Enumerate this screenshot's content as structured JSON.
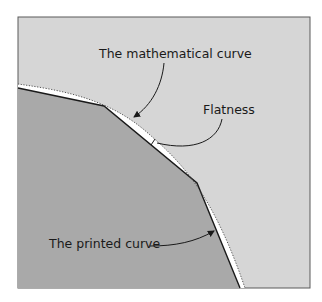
{
  "diagram": {
    "labels": {
      "mathematical_curve": "The mathematical curve",
      "flatness": "Flatness",
      "printed_curve": "The printed curve"
    },
    "colors": {
      "background": "#d6d6d6",
      "printed_region": "#a9a9a9",
      "gap": "#ffffff",
      "stroke": "#1a1a1a",
      "frame": "#5a5a5a"
    },
    "printed_curve_vertices": [
      [
        18,
        88
      ],
      [
        104,
        106
      ],
      [
        197,
        183
      ],
      [
        240,
        288
      ]
    ],
    "mathematical_curve_description": "Smooth dotted arc bounding the polygonal printed curve"
  }
}
